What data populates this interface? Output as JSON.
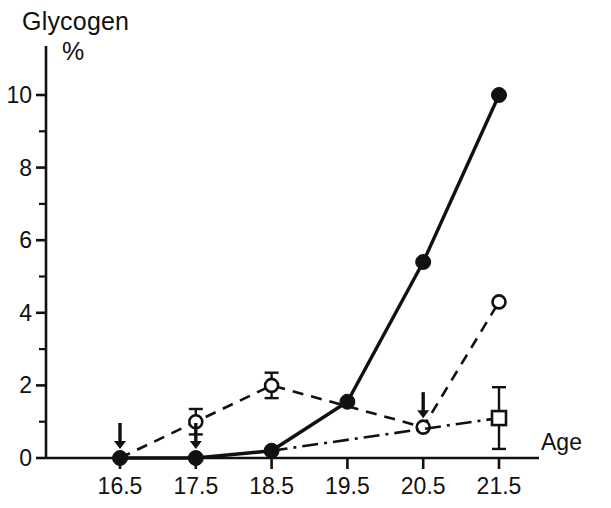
{
  "figure": {
    "name": "glycogen-vs-age-chart",
    "background": "#ffffff",
    "ink_color": "#111111"
  },
  "axis_titles": {
    "y_line1": "Glycogen",
    "y_line2": "%",
    "x_name": "Age"
  },
  "chart_data": {
    "type": "line",
    "xlabel": "Age",
    "ylabel": "Glycogen %",
    "xlim": [
      16.0,
      22.2
    ],
    "ylim": [
      0,
      10.6
    ],
    "x": [
      16.5,
      17.5,
      18.5,
      19.5,
      20.5,
      21.5
    ],
    "xticks": [
      "16.5",
      "17.5",
      "18.5",
      "19.5",
      "20.5",
      "21.5"
    ],
    "yticks": [
      "0",
      "2",
      "4",
      "6",
      "8",
      "10"
    ],
    "ytick_values": [
      0,
      2,
      4,
      6,
      8,
      10
    ],
    "yminor_values": [
      1,
      3,
      5,
      7,
      9
    ],
    "grid": false,
    "legend": "none",
    "series": [
      {
        "name": "solid-filled-circle",
        "marker": "filled-circle",
        "linestyle": "solid",
        "x": [
          16.5,
          17.5,
          18.5,
          19.5,
          20.5,
          21.5
        ],
        "values": [
          0.0,
          0.0,
          0.2,
          1.55,
          5.4,
          10.0
        ],
        "errors": [
          0,
          0,
          0,
          0,
          0,
          0
        ]
      },
      {
        "name": "dashed-open-circle",
        "marker": "open-circle",
        "linestyle": "dashed",
        "x": [
          16.5,
          17.5,
          18.5,
          20.5,
          21.5
        ],
        "values": [
          0.0,
          1.0,
          2.0,
          0.85,
          4.3
        ],
        "errors": [
          0,
          0.35,
          0.35,
          0,
          0
        ]
      },
      {
        "name": "dashdot-open-square",
        "marker": "open-square",
        "linestyle": "dash-dot",
        "x": [
          18.5,
          21.5
        ],
        "values": [
          0.2,
          1.1
        ],
        "errors": [
          0,
          0.85
        ]
      }
    ],
    "annotations": [
      {
        "type": "down-arrow",
        "x": 16.5,
        "y": 0.0
      },
      {
        "type": "down-arrow",
        "x": 17.5,
        "y": 0.0
      },
      {
        "type": "down-arrow",
        "x": 20.5,
        "y": 0.85
      }
    ]
  }
}
